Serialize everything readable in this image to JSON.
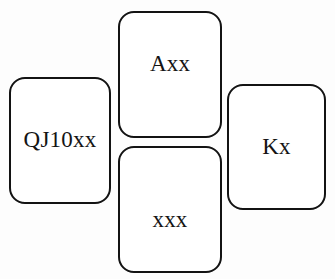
{
  "diagram": {
    "kind": "bridge-hand-cross-layout",
    "background_color": "#fdfdfd",
    "card_fill_color": "#ffffff",
    "card_border_color": "#131313",
    "text_color": "#141414",
    "cards": [
      {
        "position": "west",
        "holding": "QJ10xx"
      },
      {
        "position": "north",
        "holding": "Axx"
      },
      {
        "position": "east",
        "holding": "Kx"
      },
      {
        "position": "south",
        "holding": "xxx"
      }
    ]
  }
}
